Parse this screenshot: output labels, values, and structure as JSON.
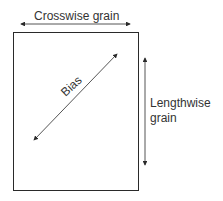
{
  "diagram": {
    "labels": {
      "crosswise": "Crosswise grain",
      "bias": "Bias",
      "lengthwise_line1": "Lengthwise",
      "lengthwise_line2": "grain"
    },
    "colors": {
      "stroke": "#2a2a2a",
      "background": "#ffffff"
    }
  }
}
